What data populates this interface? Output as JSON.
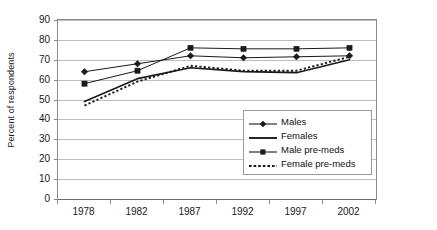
{
  "chart_data": {
    "type": "line",
    "title": "",
    "xlabel": "",
    "ylabel": "Percent of respondents",
    "categories": [
      "1978",
      "1982",
      "1987",
      "1992",
      "1997",
      "2002"
    ],
    "ylim": [
      0,
      90
    ],
    "ytick_step": 10,
    "yticks": [
      "0",
      "10",
      "20",
      "30",
      "40",
      "50",
      "60",
      "70",
      "80",
      "90"
    ],
    "grid": "horizontal",
    "legend_position": "inside lower-right",
    "series": [
      {
        "name": "Males",
        "marker": "diamond",
        "line": "solid",
        "color": "#1a1a1a",
        "values": [
          64,
          68,
          72,
          71,
          71.5,
          72
        ]
      },
      {
        "name": "Females",
        "marker": "none",
        "line": "solid",
        "color": "#1a1a1a",
        "values": [
          49,
          60.5,
          66,
          64,
          63.5,
          70
        ]
      },
      {
        "name": "Male pre-meds",
        "marker": "square",
        "line": "solid",
        "color": "#1a1a1a",
        "values": [
          58,
          64.5,
          76,
          75.5,
          75.5,
          76
        ]
      },
      {
        "name": "Female pre-meds",
        "marker": "none",
        "line": "dotted",
        "color": "#1a1a1a",
        "values": [
          47,
          59,
          67,
          64.5,
          64.5,
          71.5
        ]
      }
    ]
  }
}
